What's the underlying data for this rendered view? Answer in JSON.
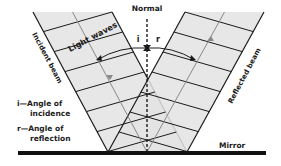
{
  "diagram": {
    "colors": {
      "beam_fill": "#e3e3e3",
      "line": "#1a1a1a",
      "ray": "#8a8a8a",
      "background": "#ffffff"
    },
    "labels": {
      "normal": "Normal",
      "incident_beam": "Incident beam",
      "reflected_beam": "Reflected beam",
      "light_waves": "Light waves",
      "angle_i": "i",
      "angle_r": "r",
      "mirror": "Mirror"
    },
    "legend": [
      {
        "symbol": "i",
        "line1": "i—Angle of",
        "line2": "incidence"
      },
      {
        "symbol": "r",
        "line1": "r—Angle of",
        "line2": "reflection"
      }
    ],
    "geometry": {
      "mirror": {
        "x1": 18,
        "x2": 266,
        "y": 153
      },
      "normal_x": 147,
      "normal_top": 19,
      "incident": {
        "left_top": [
          33,
          12
        ],
        "right_top": [
          112,
          12
        ],
        "left_bottom": [
          108,
          152
        ],
        "right_bottom": [
          187,
          152
        ]
      },
      "reflected": {
        "left_top": [
          185,
          12
        ],
        "right_top": [
          264,
          12
        ],
        "left_bottom": [
          108,
          152
        ],
        "right_bottom": [
          187,
          152
        ]
      }
    }
  }
}
